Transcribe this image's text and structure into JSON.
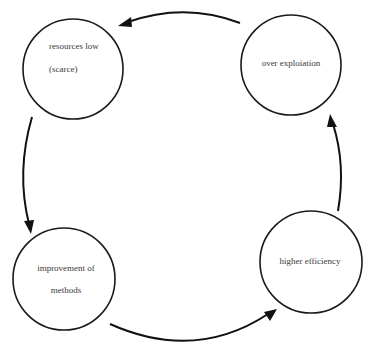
{
  "diagram": {
    "type": "cycle",
    "background": "#ffffff",
    "stroke_color": "#111111",
    "text_color": "#3a3a3a",
    "nodes": [
      {
        "id": "resources_low",
        "lines": [
          "resources low",
          "(scarce)"
        ],
        "position": "top-left"
      },
      {
        "id": "over_exploitation",
        "lines": [
          "over exploiation"
        ],
        "position": "top-right"
      },
      {
        "id": "higher_efficiency",
        "lines": [
          "higher efficiency"
        ],
        "position": "bottom-right"
      },
      {
        "id": "improvement_of_methods",
        "lines": [
          "improvement of",
          "methods"
        ],
        "position": "bottom-left"
      }
    ],
    "edges": [
      {
        "from": "over_exploitation",
        "to": "resources_low",
        "direction": "leftward-top"
      },
      {
        "from": "resources_low",
        "to": "improvement_of_methods",
        "direction": "downward-left"
      },
      {
        "from": "improvement_of_methods",
        "to": "higher_efficiency",
        "direction": "rightward-bottom"
      },
      {
        "from": "higher_efficiency",
        "to": "over_exploitation",
        "direction": "upward-right"
      }
    ]
  }
}
